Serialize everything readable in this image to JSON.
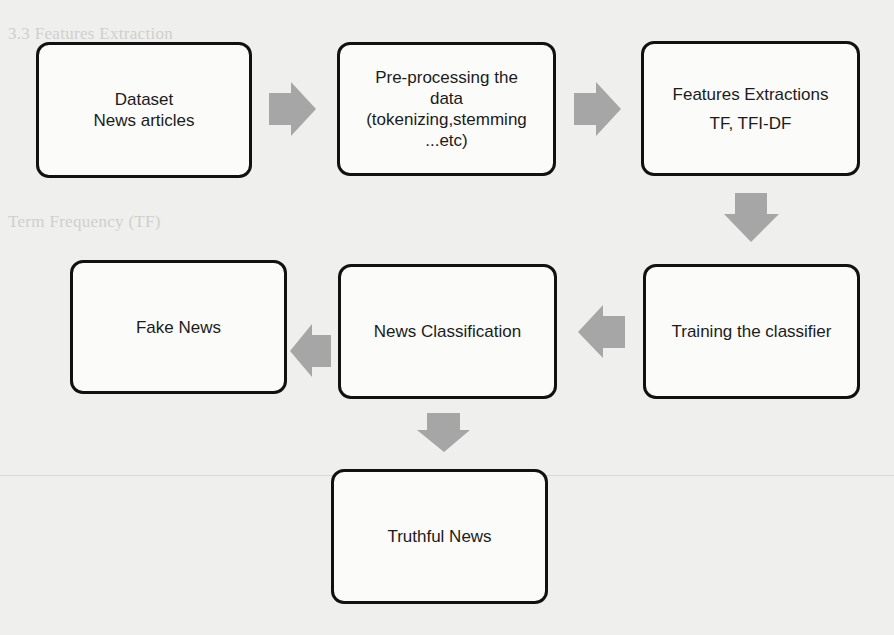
{
  "diagram": {
    "nodes": [
      {
        "id": "dataset",
        "lines": [
          "Dataset",
          "News articles"
        ]
      },
      {
        "id": "preprocessing",
        "lines": [
          "Pre-processing the",
          "data",
          "(tokenizing,stemming",
          "...etc)"
        ]
      },
      {
        "id": "features",
        "lines": [
          "Features Extractions",
          "TF, TFI-DF"
        ]
      },
      {
        "id": "training",
        "lines": [
          "Training the classifier"
        ]
      },
      {
        "id": "classification",
        "lines": [
          "News Classification"
        ]
      },
      {
        "id": "fake",
        "lines": [
          "Fake News"
        ]
      },
      {
        "id": "truthful",
        "lines": [
          "Truthful News"
        ]
      }
    ],
    "edges": [
      {
        "from": "dataset",
        "to": "preprocessing",
        "direction": "right"
      },
      {
        "from": "preprocessing",
        "to": "features",
        "direction": "right"
      },
      {
        "from": "features",
        "to": "training",
        "direction": "down"
      },
      {
        "from": "training",
        "to": "classification",
        "direction": "left"
      },
      {
        "from": "classification",
        "to": "fake",
        "direction": "left"
      },
      {
        "from": "classification",
        "to": "truthful",
        "direction": "down"
      }
    ],
    "colors": {
      "box_border": "#111111",
      "box_fill": "#fbfbfa",
      "arrow": "#a6a6a6",
      "background": "#efefed"
    }
  },
  "background_text": {
    "heading_1": "3.3 Features Extraction",
    "heading_2": "Term Frequency (TF)"
  }
}
